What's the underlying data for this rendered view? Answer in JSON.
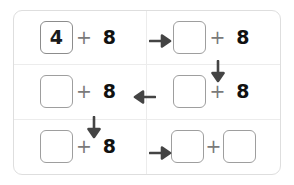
{
  "worksheet": {
    "title": "Addition chain worksheet",
    "addend_label": "8",
    "operator": "+",
    "cells": [
      {
        "id": "cell-r0c0",
        "row": 0,
        "col": 0,
        "box_value": "4",
        "box_filled": true,
        "operator": "+",
        "addend": "8",
        "second_box": false
      },
      {
        "id": "cell-r0c1",
        "row": 0,
        "col": 1,
        "box_value": "",
        "box_filled": false,
        "operator": "+",
        "addend": "8",
        "second_box": false
      },
      {
        "id": "cell-r1c0",
        "row": 1,
        "col": 0,
        "box_value": "",
        "box_filled": false,
        "operator": "+",
        "addend": "8",
        "second_box": false
      },
      {
        "id": "cell-r1c1",
        "row": 1,
        "col": 1,
        "box_value": "",
        "box_filled": false,
        "operator": "+",
        "addend": "8",
        "second_box": false
      },
      {
        "id": "cell-r2c0",
        "row": 2,
        "col": 0,
        "box_value": "",
        "box_filled": false,
        "operator": "+",
        "addend": "8",
        "second_box": false
      },
      {
        "id": "cell-r2c1",
        "row": 2,
        "col": 1,
        "box_value": "",
        "box_filled": false,
        "operator": "+",
        "addend": "",
        "second_box": true,
        "second_box_value": ""
      }
    ],
    "arrows": [
      {
        "id": "arrow-r0-right",
        "direction": "right",
        "icon": "arrow-right-icon"
      },
      {
        "id": "arrow-c1-down",
        "direction": "down",
        "icon": "arrow-down-icon"
      },
      {
        "id": "arrow-r1-left",
        "direction": "left",
        "icon": "arrow-left-icon"
      },
      {
        "id": "arrow-c0-down",
        "direction": "down",
        "icon": "arrow-down-icon"
      },
      {
        "id": "arrow-r2-right",
        "direction": "right",
        "icon": "arrow-right-icon"
      }
    ]
  },
  "colors": {
    "frame_border": "#dedede",
    "grid_divider": "#ececec",
    "box_border": "#9e9e9e",
    "digit": "#111111",
    "operator": "#7a7a7a",
    "arrow": "#444444",
    "background": "#ffffff"
  }
}
